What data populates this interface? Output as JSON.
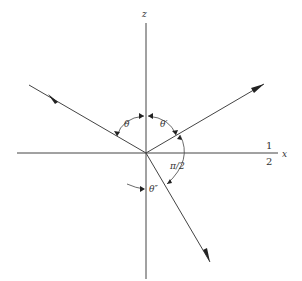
{
  "diagram": {
    "type": "ray-refraction-geometry",
    "axes": {
      "z_label": "z",
      "x_label": "x",
      "x_side_fraction": {
        "numerator": "1",
        "denominator": "2"
      }
    },
    "angles": {
      "incident": "θ",
      "reflected": "θ′",
      "transmitted": "θ″",
      "right_angle": "π/2"
    },
    "rays": [
      "incident",
      "reflected",
      "transmitted"
    ],
    "colors": {
      "line": "#444444",
      "text": "#333333",
      "background": "#ffffff"
    }
  }
}
